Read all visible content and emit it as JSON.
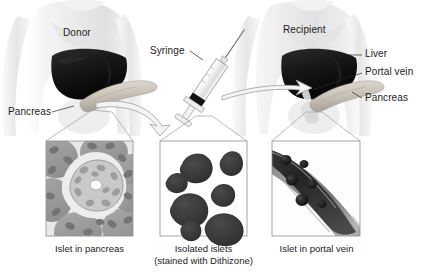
{
  "figure": {
    "background_color": "#ffffff",
    "text_color": "#1c1c1c"
  },
  "labels": {
    "donor": "Donor",
    "recipient": "Recipient",
    "syringe": "Syringe",
    "pancreas_donor": "Pancreas",
    "liver": "Liver",
    "portal_vein": "Portal vein",
    "pancreas_recipient": "Pancreas"
  },
  "panels": [
    {
      "id": "islet-in-pancreas",
      "caption_line1": "Islet in pancreas",
      "caption_line2": "",
      "description": "Histology of pancreas showing a pale central islet of Langerhans surrounded by darker acinar tissue with oval nuclei",
      "tissue_color": "#9a9a9a",
      "islet_color": "#c9c9c9",
      "nucleus_color": "#7d7d7d"
    },
    {
      "id": "isolated-islets",
      "caption_line1": "Isolated islets",
      "caption_line2": "(stained with Dithizone)",
      "description": "Seven dark stained isolated islets on a white background",
      "islet_count": 7,
      "islet_color": "#3a3a3a",
      "background_color": "#ffffff"
    },
    {
      "id": "islet-in-portal-vein",
      "caption_line1": "Islet in portal vein",
      "caption_line2": "",
      "description": "Cross-section of a portal vein running diagonally with dark round islets lodged inside the lumen",
      "islet_count": 6,
      "vessel_wall_color": "#8f8f8f",
      "lumen_color": "#2e2e2e"
    }
  ],
  "anatomy": {
    "liver_color": "#1a1a1a",
    "pancreas_color": "#c3bcb2",
    "body_color": "#e9e9e9",
    "arrow_outline_color": "#8c8c8c"
  }
}
